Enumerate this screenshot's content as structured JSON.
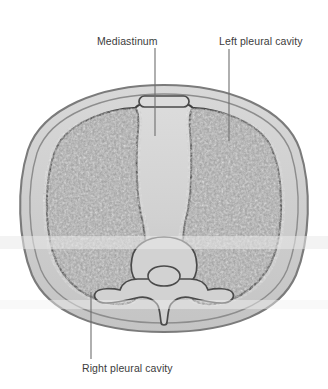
{
  "figure": {
    "type": "anatomical-cross-section",
    "canvas": {
      "width": 328,
      "height": 389,
      "background": "#ffffff"
    },
    "labels": {
      "mediastinum": "Mediastinum",
      "left_pleural_cavity": "Left pleural cavity",
      "right_pleural_cavity": "Right pleural cavity"
    },
    "label_color": "#3c3c3c",
    "leader_line_color": "#6e6e6e",
    "colors": {
      "body_wall_fill": "#cfcfcf",
      "body_wall_outline": "#7b7b7b",
      "lung_fill": "#9b9b9b",
      "lung_outline": "#3f3f3f",
      "mediastinum_fill": "#d4d4d4",
      "mediastinum_outline": "#3f3f3f",
      "sternum_fill": "#dcdcdc",
      "sternum_outline": "#4a4a4a",
      "vertebra_fill": "#d2d2d2",
      "vertebra_outline": "#4a4a4a",
      "scan_band": "#ededed"
    },
    "structures": [
      {
        "name": "body-wall",
        "label": "Thoracic body wall"
      },
      {
        "name": "sternum",
        "label": "Sternum"
      },
      {
        "name": "mediastinum",
        "label": "Mediastinum"
      },
      {
        "name": "right-lung",
        "label": "Right pleural cavity / lung"
      },
      {
        "name": "left-lung",
        "label": "Left pleural cavity / lung"
      },
      {
        "name": "vertebra",
        "label": "Thoracic vertebra"
      },
      {
        "name": "vertebral-foramen",
        "label": "Vertebral foramen"
      },
      {
        "name": "spinous-process",
        "label": "Spinous process"
      },
      {
        "name": "transverse-process-left",
        "label": "Left transverse process"
      },
      {
        "name": "transverse-process-right",
        "label": "Right transverse process"
      }
    ]
  }
}
